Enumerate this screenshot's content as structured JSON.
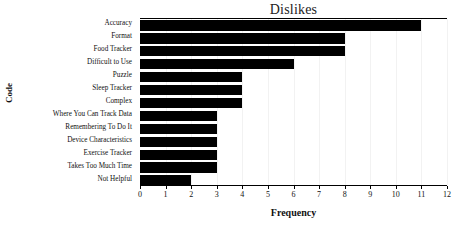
{
  "chart_data": {
    "type": "bar",
    "orientation": "horizontal",
    "title": "Dislikes",
    "xlabel": "Frequency",
    "ylabel": "Code",
    "xlim": [
      0,
      12
    ],
    "xticks": [
      0,
      1,
      2,
      3,
      4,
      5,
      6,
      7,
      8,
      9,
      10,
      11,
      12
    ],
    "grid": false,
    "legend": null,
    "bar_color": "#000000",
    "categories": [
      "Accuracy",
      "Format",
      "Food Tracker",
      "Difficult to Use",
      "Puzzle",
      "Sleep Tracker",
      "Complex",
      "Where You Can Track Data",
      "Remembering To Do It",
      "Device Characteristics",
      "Exercise Tracker",
      "Takes Too Much Time",
      "Not Helpful"
    ],
    "values": [
      11,
      8,
      8,
      6,
      4,
      4,
      4,
      3,
      3,
      3,
      3,
      3,
      2
    ]
  }
}
